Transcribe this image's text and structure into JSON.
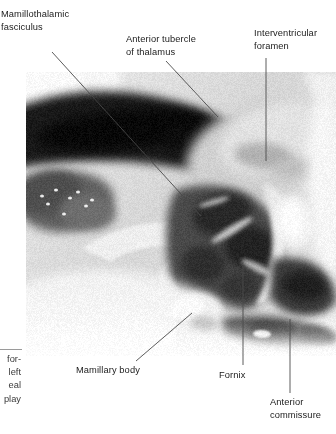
{
  "figure": {
    "kind": "anatomical-photograph",
    "plate": {
      "x": 26,
      "y": 72,
      "width": 310,
      "height": 284,
      "background_color": "#ffffff",
      "tone": "black-and-white halftone photograph"
    }
  },
  "labels": [
    {
      "id": "mamillothalamic-fasciculus",
      "text": "Mamillothalamic\nfasciculus",
      "x": 1,
      "y": 8,
      "leader": {
        "type": "line",
        "x1": 52,
        "y1": 52,
        "x2": 201,
        "y2": 216
      }
    },
    {
      "id": "anterior-tubercle-of-thalamus",
      "text": "Anterior tubercle\nof thalamus",
      "x": 126,
      "y": 33,
      "leader": {
        "type": "line",
        "x1": 166,
        "y1": 61,
        "x2": 218,
        "y2": 117
      }
    },
    {
      "id": "interventricular-foramen",
      "text": "Interventricular\nforamen",
      "x": 254,
      "y": 27,
      "leader": {
        "type": "line",
        "x1": 266,
        "y1": 58,
        "x2": 266,
        "y2": 161
      }
    },
    {
      "id": "mamillary-body",
      "text": "Mamillary body",
      "x": 76,
      "y": 364,
      "leader": {
        "type": "line",
        "x1": 136,
        "y1": 361,
        "x2": 192,
        "y2": 313
      }
    },
    {
      "id": "fornix",
      "text": "Fornix",
      "x": 219,
      "y": 369,
      "leader": {
        "type": "line",
        "x1": 243,
        "y1": 266,
        "x2": 243,
        "y2": 365
      }
    },
    {
      "id": "anterior-commissure",
      "text": "Anterior\ncommissure",
      "x": 270,
      "y": 396,
      "leader": {
        "type": "line",
        "x1": 290,
        "y1": 319,
        "x2": 290,
        "y2": 393
      }
    }
  ],
  "caption_fragment": {
    "clipped": true,
    "alignment": "right",
    "lines": [
      "for-",
      "left",
      "eal",
      "play"
    ],
    "rule_color": "#9a9a9a"
  },
  "colors": {
    "text": "#1b1b1b",
    "caption_text": "#3a3a3a",
    "leader_line": "#4a4a4a",
    "page_background": "#ffffff"
  },
  "typography": {
    "label_font_size_px": 9.3,
    "label_line_height_px": 12.6
  }
}
